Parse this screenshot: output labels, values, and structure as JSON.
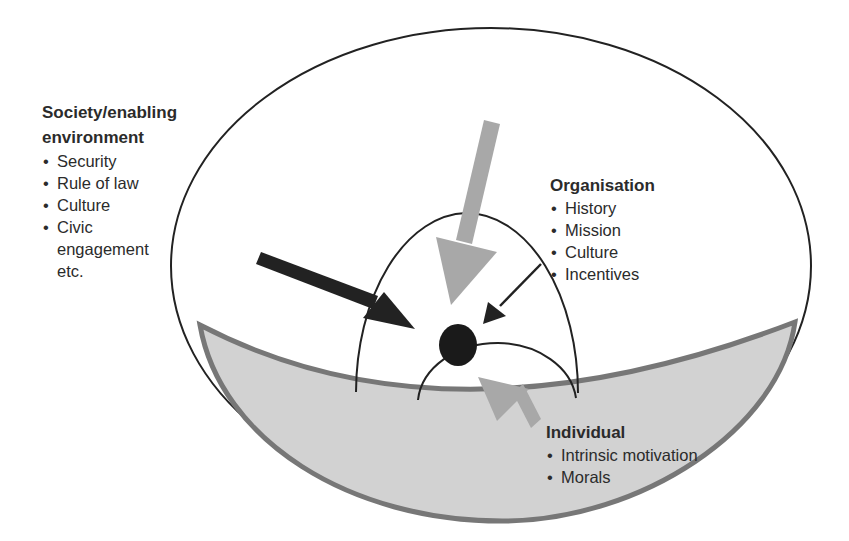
{
  "diagram": {
    "type": "nested-levels",
    "colors": {
      "outline": "#222222",
      "bowl_fill": "#d2d2d2",
      "bowl_stroke": "#777777",
      "gray_arrow": "#a8a8a8",
      "dark_arrow": "#222222",
      "center_dot": "#1a1a1a"
    },
    "levels": {
      "society": {
        "heading": "Society/enabling environment",
        "heading_line1": "Society/enabling",
        "heading_line2": "environment",
        "items": [
          "Security",
          "Rule of law",
          "Culture",
          "Civic engagement etc."
        ],
        "item_lines": [
          "Security",
          "Rule of law",
          "Culture",
          "Civic",
          "engagement",
          "etc."
        ]
      },
      "organisation": {
        "heading": "Organisation",
        "items": [
          "History",
          "Mission",
          "Culture",
          "Incentives"
        ]
      },
      "individual": {
        "heading": "Individual",
        "items": [
          "Intrinsic motivation",
          "Morals"
        ]
      }
    },
    "arrows": [
      {
        "name": "society-arrow",
        "style": "thick-dark",
        "from": "left",
        "to": "center"
      },
      {
        "name": "top-gray-arrow",
        "style": "thick-gray",
        "from": "top",
        "to": "center"
      },
      {
        "name": "organisation-arrow",
        "style": "thin-dark",
        "from": "organisation",
        "to": "center"
      },
      {
        "name": "individual-arrow",
        "style": "gray",
        "from": "individual",
        "to": "center"
      }
    ]
  }
}
